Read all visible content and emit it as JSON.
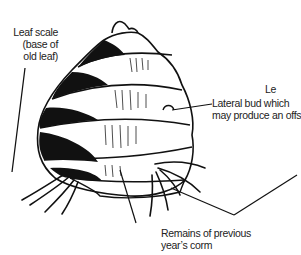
{
  "diagram": {
    "subject": "corm",
    "labels": {
      "leaf_scale": [
        "Leaf scale",
        "(base of",
        "old leaf)"
      ],
      "lateral_bud": [
        "Lateral bud which",
        "may produce an offset"
      ],
      "remains": [
        "Remains of previous",
        "year’s corm"
      ],
      "cut_off": "Le"
    }
  }
}
